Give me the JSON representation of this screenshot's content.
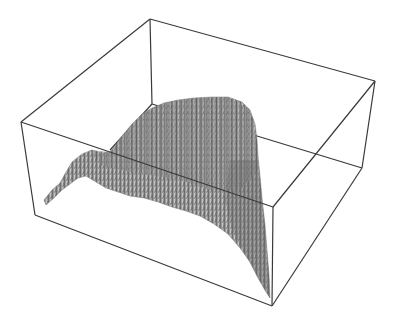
{
  "figure": {
    "colors": {
      "background": "#ffffff",
      "box_edges": "#3a3a3a",
      "surface_light": "#b8b8b8",
      "surface_mid": "#8a8a8a",
      "surface_dark": "#555555"
    },
    "box": {
      "back_top_left": [
        150,
        19
      ],
      "back_top_right": [
        375,
        81
      ],
      "back_bottom_left": [
        152,
        104
      ],
      "back_bottom_right": [
        362,
        168
      ],
      "front_top_left": [
        21,
        122
      ],
      "front_top_right": [
        273,
        207
      ],
      "front_bottom_left": [
        35,
        215
      ],
      "front_bottom_right": [
        272,
        306
      ]
    },
    "surface_outline": "44,200 52,190 60,183 66,172 72,162 82,154 92,150 102,153 110,152 116,145 122,136 132,124 142,114 152,108 164,103 178,100 194,98 212,97 228,97 242,102 250,110 255,124 257,140 258,156 260,176 262,198 265,225 267,250 269,275 270,298 266,292 258,278 250,262 240,248 228,234 214,224 200,216 186,211 172,207 158,202 144,198 130,196 118,192 106,188 96,182 86,176 78,178 70,184 62,190 54,198 46,205",
    "surface_shade_back": "90,150 110,152 122,136 142,114 164,103 194,98 228,97 250,110 257,140 258,170 240,190 210,190 180,180 150,175 120,170 100,165",
    "surface_shade_front_right": "230,160 258,160 262,198 266,240 269,275 270,298 258,278 244,252 232,230 225,200"
  }
}
